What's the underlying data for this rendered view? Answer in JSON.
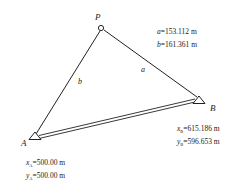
{
  "diagram": {
    "points": {
      "P": {
        "label": "P",
        "x": 101,
        "y": 28
      },
      "A": {
        "label": "A",
        "x": 35,
        "y": 137
      },
      "B": {
        "label": "B",
        "x": 199,
        "y": 100
      }
    },
    "sides": {
      "a": {
        "label": "a"
      },
      "b": {
        "label": "b"
      }
    },
    "known_distances": {
      "a_var": "a",
      "a_value": "=153.112 m",
      "b_var": "b",
      "b_value": "=161.361 m"
    },
    "coords_B": {
      "x_var": "x",
      "x_sub": "B",
      "x_value": "=615.186 m",
      "y_var": "y",
      "y_sub": "B",
      "y_value": "=596.653 m"
    },
    "coords_A": {
      "x_var": "x",
      "x_sub": "A",
      "x_value": "=500.00 m",
      "y_var": "y",
      "y_sub": "A",
      "y_value": "=500.00 m"
    },
    "colors": {
      "line": "#222222",
      "background": "#ffffff"
    }
  }
}
